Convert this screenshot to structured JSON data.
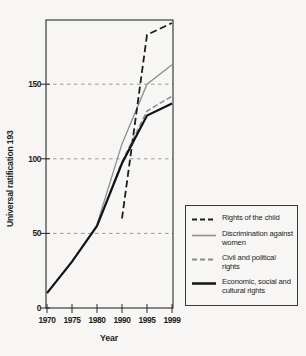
{
  "page": {
    "background": "#f7f6f4"
  },
  "chart_data": {
    "type": "line",
    "title": "",
    "xlabel": "Year",
    "ylabel": "Universal ratification 193",
    "x_tick_labels": [
      "1970",
      "1975",
      "1980",
      "1990",
      "1995",
      "1999"
    ],
    "x_categories": [
      1970,
      1975,
      1980,
      1990,
      1995,
      1999
    ],
    "y_tick_labels": [
      "0",
      "50",
      "100",
      "150"
    ],
    "y_tick_values": [
      0,
      50,
      100,
      150
    ],
    "ylim": [
      0,
      193
    ],
    "grid": "horizontal-dashed",
    "gridline_values": [
      50,
      100,
      150
    ],
    "axis_color": "#2a2a2a",
    "gridline_color": "#8f8f8f",
    "legend_position": "outside-right-bottom",
    "series": [
      {
        "name": "Rights of the child",
        "color": "#1c1c1c",
        "dash": "7 3.5",
        "width": 1.8,
        "z": 4,
        "points": [
          [
            1990,
            60
          ],
          [
            1995,
            183
          ],
          [
            1999,
            191
          ]
        ]
      },
      {
        "name": "Discrimination against women",
        "color": "#8e8e8e",
        "dash": "",
        "width": 1.3,
        "z": 1,
        "points": [
          [
            1980,
            56
          ],
          [
            1990,
            110
          ],
          [
            1995,
            150
          ],
          [
            1999,
            163
          ]
        ]
      },
      {
        "name": "Civil and political rights",
        "color": "#8a8a8a",
        "dash": "5.5 2.5",
        "width": 1.5,
        "z": 2,
        "points": [
          [
            1970,
            10
          ],
          [
            1975,
            31
          ],
          [
            1980,
            55
          ],
          [
            1990,
            98
          ],
          [
            1995,
            132
          ],
          [
            1999,
            142
          ]
        ]
      },
      {
        "name": "Economic, social and cultural rights",
        "color": "#141414",
        "dash": "",
        "width": 2.2,
        "z": 3,
        "points": [
          [
            1970,
            10
          ],
          [
            1975,
            31
          ],
          [
            1980,
            55
          ],
          [
            1990,
            97
          ],
          [
            1995,
            129
          ],
          [
            1999,
            137
          ]
        ]
      }
    ]
  }
}
